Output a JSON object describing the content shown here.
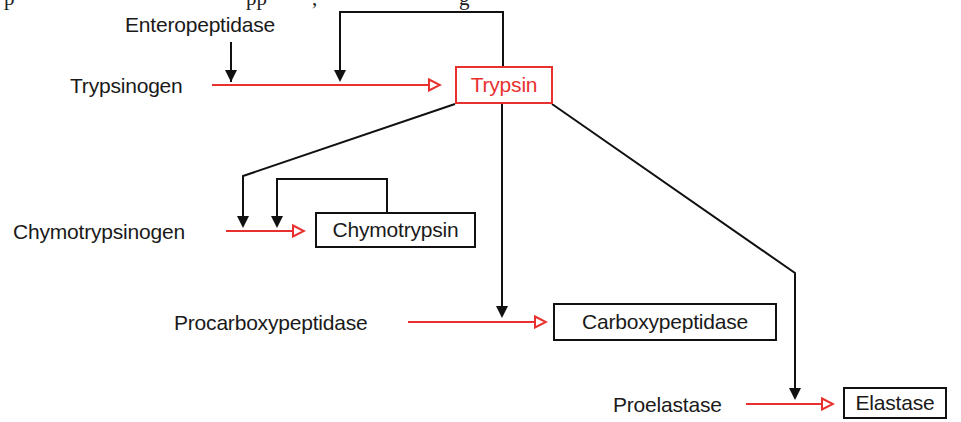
{
  "colors": {
    "activation_arrow": "#e8312f",
    "trypsin_box": "#e8312f",
    "catalysis_arrow": "#111111",
    "text": "#1a1a1a"
  },
  "clipped_header_text": "p ... pp ... , ... g",
  "activator": {
    "label": "Enteropeptidase"
  },
  "zymogens": {
    "trypsinogen": "Trypsinogen",
    "chymotrypsinogen": "Chymotrypsinogen",
    "procarboxypeptidase": "Procarboxypeptidase",
    "proelastase": "Proelastase"
  },
  "enzymes": {
    "trypsin": "Trypsin",
    "chymotrypsin": "Chymotrypsin",
    "carboxypeptidase": "Carboxypeptidase",
    "elastase": "Elastase"
  },
  "edges": [
    {
      "from": "Trypsinogen",
      "to": "Trypsin",
      "type": "activation"
    },
    {
      "from": "Enteropeptidase",
      "to": "Trypsinogen->Trypsin",
      "type": "catalysis"
    },
    {
      "from": "Trypsin",
      "to": "Trypsinogen->Trypsin",
      "type": "catalysis (autoactivation)"
    },
    {
      "from": "Chymotrypsinogen",
      "to": "Chymotrypsin",
      "type": "activation"
    },
    {
      "from": "Trypsin",
      "to": "Chymotrypsinogen->Chymotrypsin",
      "type": "catalysis"
    },
    {
      "from": "Chymotrypsin",
      "to": "Chymotrypsinogen->Chymotrypsin",
      "type": "catalysis (autoactivation)"
    },
    {
      "from": "Procarboxypeptidase",
      "to": "Carboxypeptidase",
      "type": "activation"
    },
    {
      "from": "Trypsin",
      "to": "Procarboxypeptidase->Carboxypeptidase",
      "type": "catalysis"
    },
    {
      "from": "Proelastase",
      "to": "Elastase",
      "type": "activation"
    },
    {
      "from": "Trypsin",
      "to": "Proelastase->Elastase",
      "type": "catalysis"
    }
  ]
}
